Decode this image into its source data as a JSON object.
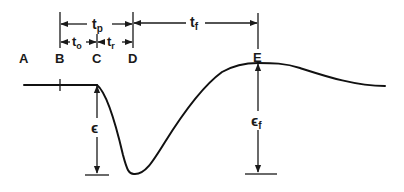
{
  "diagram": {
    "points": {
      "A": "A",
      "B": "B",
      "C": "C",
      "D": "D",
      "E": "E"
    },
    "intervals": {
      "tp": {
        "base": "t",
        "sub": "p"
      },
      "to": {
        "base": "t",
        "sub": "o"
      },
      "tr": {
        "base": "t",
        "sub": "r"
      },
      "tf": {
        "base": "t",
        "sub": "f"
      }
    },
    "amplitudes": {
      "eps": {
        "base": "ϵ",
        "sub": ""
      },
      "eps_f": {
        "base": "ϵ",
        "sub": "f"
      }
    },
    "colors": {
      "ink": "#1a1a1a",
      "background": "#ffffff"
    }
  }
}
